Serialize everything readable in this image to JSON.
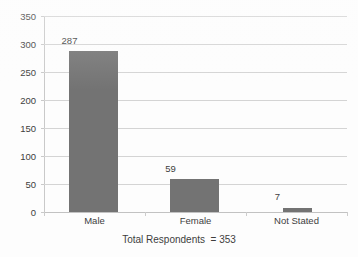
{
  "chart_data": {
    "type": "bar",
    "title": "",
    "subtitle": "",
    "xlabel": "",
    "ylabel": "",
    "categories": [
      "Male",
      "Female",
      "Not Stated"
    ],
    "values": [
      287,
      59,
      7
    ],
    "value_labels": [
      "287",
      "59",
      "7"
    ],
    "ylim": [
      0,
      350
    ],
    "y_ticks": [
      0,
      50,
      100,
      150,
      200,
      250,
      300,
      350
    ],
    "y_tick_labels": [
      "0",
      "50",
      "100",
      "150",
      "200",
      "250",
      "300",
      "350"
    ],
    "grid": true,
    "legend": false,
    "legend_position": "none",
    "bar_color": "#737373",
    "gridline_color": "#d4d4d4",
    "axis_color": "#c2c2c2",
    "text_color": "#3d3d3d",
    "background_color": "#fdfdfd",
    "annotations": [
      {
        "name": "total-respondents-caption",
        "text": "Total Respondents  = 353",
        "position": "below-axis-centered"
      }
    ]
  },
  "caption": {
    "text": "Total Respondents  = 353"
  }
}
